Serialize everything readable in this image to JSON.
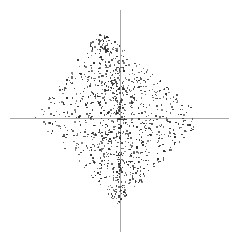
{
  "figure": {
    "width": 239,
    "height": 242,
    "background_color": "#ffffff"
  },
  "axes": {
    "x_axis": {
      "name": "horizontal-axis",
      "color": "#a8a8a8",
      "thickness_px": 1,
      "start_x_px": 10,
      "end_x_px": 229,
      "y_px": 118
    },
    "y_axis": {
      "name": "vertical-axis",
      "color": "#a8a8a8",
      "thickness_px": 1,
      "start_y_px": 10,
      "end_y_px": 232,
      "x_px": 120
    },
    "origin_px": [
      120,
      118
    ]
  },
  "chart_data": {
    "type": "scatter",
    "title": "",
    "subtitle": "",
    "xlabel": "",
    "ylabel": "",
    "xlim": [
      -1.15,
      1.15
    ],
    "ylim": [
      -1.15,
      1.15
    ],
    "grid": false,
    "legend": null,
    "legend_position": "none",
    "annotations": [],
    "xticks": [],
    "yticks": [],
    "marker": {
      "shape": "square",
      "size_px": 1.4,
      "color": "#2b2b2b"
    },
    "series": [
      {
        "name": "points",
        "n_points": 1150,
        "distribution": "diamond",
        "description": "Points fill a rotated-square (L1 ball) region centered on the origin, denser toward the center, with the apex slightly left of the vertical axis.",
        "shape_params": {
          "center_px": [
            119,
            117
          ],
          "half_width_px": 85,
          "half_height_px": 88,
          "apex_offset_px": -19,
          "density_exponent": 0.62,
          "seed": 20240517
        }
      }
    ]
  }
}
